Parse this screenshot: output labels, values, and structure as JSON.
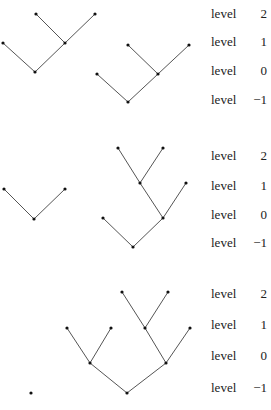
{
  "panels": [
    {
      "labels": [
        {
          "word": "level",
          "num": "2",
          "y": 15
        },
        {
          "word": "level",
          "num": "1",
          "y": 43
        },
        {
          "word": "level",
          "num": "0",
          "y": 72
        },
        {
          "word": "level",
          "num": "−1",
          "y": 101
        }
      ],
      "trees": [
        {
          "nodes": [
            [
              36,
              14
            ],
            [
              95,
              14
            ],
            [
              65,
              43
            ],
            [
              3,
              43
            ],
            [
              35,
              72
            ]
          ],
          "edges": [
            [
              0,
              2
            ],
            [
              1,
              2
            ],
            [
              2,
              4
            ],
            [
              3,
              4
            ]
          ]
        },
        {
          "nodes": [
            [
              128,
              45
            ],
            [
              189,
              45
            ],
            [
              158,
              74
            ],
            [
              97,
              74
            ],
            [
              128,
              102
            ]
          ],
          "edges": [
            [
              0,
              2
            ],
            [
              1,
              2
            ],
            [
              2,
              4
            ],
            [
              3,
              4
            ]
          ]
        }
      ]
    },
    {
      "labels": [
        {
          "word": "level",
          "num": "2",
          "y": 157
        },
        {
          "word": "level",
          "num": "1",
          "y": 187
        },
        {
          "word": "level",
          "num": "0",
          "y": 216
        },
        {
          "word": "level",
          "num": "−1",
          "y": 244
        }
      ],
      "trees": [
        {
          "nodes": [
            [
              4,
              189
            ],
            [
              65,
              189
            ],
            [
              34,
              219
            ]
          ],
          "edges": [
            [
              0,
              2
            ],
            [
              1,
              2
            ]
          ]
        },
        {
          "nodes": [
            [
              118,
              148
            ],
            [
              163,
              148
            ],
            [
              140,
              183
            ],
            [
              186,
              183
            ],
            [
              163,
              218
            ],
            [
              103,
              218
            ],
            [
              133,
              247
            ]
          ],
          "edges": [
            [
              0,
              2
            ],
            [
              1,
              2
            ],
            [
              2,
              4
            ],
            [
              3,
              4
            ],
            [
              4,
              6
            ],
            [
              5,
              6
            ]
          ]
        }
      ]
    },
    {
      "labels": [
        {
          "word": "level",
          "num": "2",
          "y": 295
        },
        {
          "word": "level",
          "num": "1",
          "y": 326
        },
        {
          "word": "level",
          "num": "0",
          "y": 357
        },
        {
          "word": "level",
          "num": "−1",
          "y": 389
        }
      ],
      "trees": [
        {
          "nodes": [
            [
              31,
              393
            ]
          ],
          "edges": []
        },
        {
          "nodes": [
            [
              122,
              292
            ],
            [
              168,
              292
            ],
            [
              145,
              328
            ],
            [
              190,
              328
            ],
            [
              67,
              328
            ],
            [
              111,
              328
            ],
            [
              90,
              363
            ],
            [
              166,
              363
            ],
            [
              127,
              393
            ]
          ],
          "edges": [
            [
              0,
              2
            ],
            [
              1,
              2
            ],
            [
              2,
              7
            ],
            [
              3,
              7
            ],
            [
              4,
              6
            ],
            [
              5,
              6
            ],
            [
              6,
              8
            ],
            [
              7,
              8
            ]
          ]
        }
      ]
    }
  ]
}
